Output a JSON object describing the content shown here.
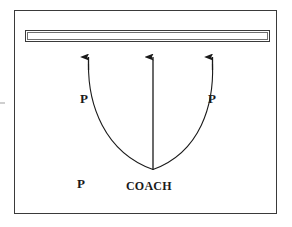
{
  "diagram": {
    "court": {
      "name": "court-boundary",
      "border_color": "#3a3a3a",
      "fill_color": "#ffffff"
    },
    "net": {
      "name": "net-bar",
      "border_color": "#3a3a3a",
      "inner_border_color": "#6f6f6f"
    },
    "stroke_color": "#1a1a1a",
    "labels": {
      "player_left": "P",
      "player_right": "P",
      "player_bottom": "P",
      "coach": "COACH"
    },
    "arrows": [
      {
        "name": "arrow-left",
        "x": 88,
        "tip_y": 55,
        "direction": "up"
      },
      {
        "name": "arrow-center",
        "x": 153,
        "tip_y": 55,
        "direction": "up"
      },
      {
        "name": "arrow-right",
        "x": 212,
        "tip_y": 55,
        "direction": "up"
      }
    ],
    "curve": {
      "name": "u-shaped-path",
      "description": "U-shaped movement path from left arrow base down through bottom vertex and up to right arrow base",
      "vertex_x": 153,
      "vertex_y": 170
    },
    "center_line": {
      "name": "center-vertical-line",
      "x": 153,
      "from_y": 170,
      "to_y": 60
    }
  }
}
